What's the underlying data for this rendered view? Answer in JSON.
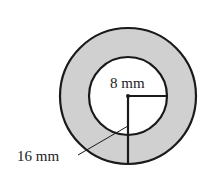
{
  "diagram": {
    "type": "annulus",
    "shading_color": "#d0d0d0",
    "stroke_color": "#1a1a1a",
    "inner_radius_label": "8 mm",
    "outer_radius_label": "16 mm"
  }
}
